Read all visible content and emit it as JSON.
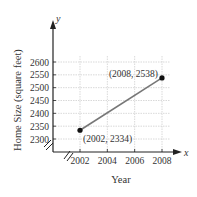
{
  "chart_data": {
    "type": "line",
    "title": "",
    "xlabel": "Year",
    "ylabel": "Home Size (square feet)",
    "x_axis_var": "x",
    "y_axis_var": "y",
    "x_ticks": [
      "2002",
      "2004",
      "2006",
      "2008"
    ],
    "y_ticks": [
      "2300",
      "2350",
      "2400",
      "2450",
      "2500",
      "2550",
      "2600"
    ],
    "xlim": [
      2000,
      2009
    ],
    "ylim": [
      2300,
      2620
    ],
    "grid": true,
    "axis_break": true,
    "series": [
      {
        "name": "Home size",
        "color": "#777777",
        "points": [
          {
            "x": 2002,
            "y": 2334,
            "label": "(2002, 2334)"
          },
          {
            "x": 2008,
            "y": 2538,
            "label": "(2008, 2538)"
          }
        ]
      }
    ]
  }
}
